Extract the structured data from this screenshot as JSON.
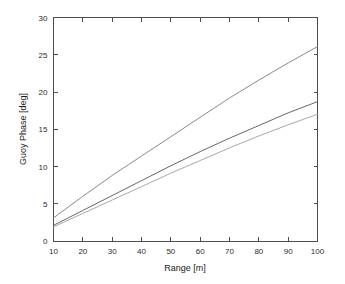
{
  "chart_data": {
    "type": "line",
    "title": "",
    "xlabel": "Range [m]",
    "ylabel": "Guoy Phase [deg]",
    "xlim": [
      10,
      100
    ],
    "ylim": [
      0,
      30
    ],
    "xticks": [
      10,
      20,
      30,
      40,
      50,
      60,
      70,
      80,
      90,
      100
    ],
    "xticklabels": [
      "10",
      "20",
      "30",
      "40",
      "50",
      "60",
      "70",
      "80",
      "90",
      "100"
    ],
    "yticks": [
      0,
      5,
      10,
      15,
      20,
      25,
      30
    ],
    "yticklabels": [
      "0",
      "5",
      "10",
      "15",
      "20",
      "25",
      "30"
    ],
    "grid": false,
    "legend": "none",
    "x": [
      10,
      20,
      30,
      40,
      50,
      60,
      70,
      80,
      90,
      100
    ],
    "series": [
      {
        "name": "curve-1",
        "color": "#7d7d7d",
        "values": [
          3.1,
          6.0,
          8.8,
          11.4,
          14.0,
          16.6,
          19.2,
          21.6,
          23.9,
          26.1
        ]
      },
      {
        "name": "curve-2",
        "color": "#555555",
        "values": [
          2.1,
          4.1,
          6.1,
          8.1,
          10.1,
          12.0,
          13.8,
          15.5,
          17.2,
          18.7
        ]
      },
      {
        "name": "curve-3",
        "color": "#9e9e9e",
        "values": [
          1.9,
          3.7,
          5.5,
          7.3,
          9.1,
          10.8,
          12.5,
          14.1,
          15.6,
          17.0
        ]
      }
    ]
  },
  "colors": {
    "background": "#ffffff",
    "axis": "#4d4d4d",
    "text": "#1a1a1a"
  }
}
